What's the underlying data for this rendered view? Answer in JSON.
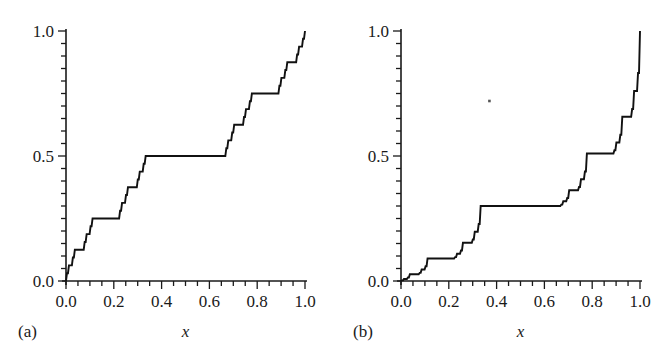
{
  "figure": {
    "background": "#ffffff",
    "ink": "#1a1a1a",
    "curve_color": "#111111",
    "width": 670,
    "height": 362
  },
  "chart_data": [
    {
      "type": "line",
      "panel": "a",
      "panel_label": "(a)",
      "title": "",
      "subtitle": "",
      "xlabel": "x",
      "ylabel": "",
      "xlim": [
        0.0,
        1.0
      ],
      "ylim": [
        0.0,
        1.0
      ],
      "grid": false,
      "legend": null,
      "xticks": [
        0.0,
        0.1,
        0.2,
        0.3,
        0.4,
        0.5,
        0.6,
        0.7,
        0.8,
        0.9,
        1.0
      ],
      "xticklabels": [
        "0.0",
        "",
        "0.2",
        "",
        "0.4",
        "",
        "0.6",
        "",
        "0.8",
        "",
        "1.0"
      ],
      "xminorticks": [
        0.05,
        0.15,
        0.25,
        0.35,
        0.45,
        0.55,
        0.65,
        0.75,
        0.85,
        0.95
      ],
      "yticks": [
        0.0,
        0.1,
        0.2,
        0.3,
        0.4,
        0.5,
        0.6,
        0.7,
        0.8,
        0.9,
        1.0
      ],
      "yticklabels": [
        "0.0",
        "",
        "",
        "",
        "",
        "0.5",
        "",
        "",
        "",
        "",
        "1.0"
      ],
      "yminorticks": [
        0.05,
        0.15,
        0.25,
        0.35,
        0.45,
        0.55,
        0.65,
        0.75,
        0.85,
        0.95
      ],
      "description": "Cantor function (devil's staircase), symmetric measure",
      "curve": {
        "kind": "cantor-staircase",
        "left_weight": 0.5,
        "depth": 5,
        "middle_third_cut": [
          0.3333333333,
          0.6666666667
        ],
        "plateaus": [
          {
            "x_start": 0.3333333333,
            "x_end": 0.6666666667,
            "y": 0.5
          },
          {
            "x_start": 0.1111111111,
            "x_end": 0.2222222222,
            "y": 0.25
          },
          {
            "x_start": 0.7777777778,
            "x_end": 0.8888888889,
            "y": 0.75
          }
        ],
        "anchor_points": [
          {
            "x": 0.0,
            "y": 0.0
          },
          {
            "x": 0.3333333333,
            "y": 0.5
          },
          {
            "x": 0.6666666667,
            "y": 0.5
          },
          {
            "x": 1.0,
            "y": 1.0
          }
        ]
      }
    },
    {
      "type": "line",
      "panel": "b",
      "panel_label": "(b)",
      "title": "",
      "subtitle": "",
      "xlabel": "x",
      "ylabel": "",
      "xlim": [
        0.0,
        1.0
      ],
      "ylim": [
        0.0,
        1.0
      ],
      "grid": false,
      "legend": null,
      "xticks": [
        0.0,
        0.1,
        0.2,
        0.3,
        0.4,
        0.5,
        0.6,
        0.7,
        0.8,
        0.9,
        1.0
      ],
      "xticklabels": [
        "0.0",
        "",
        "0.2",
        "",
        "0.4",
        "",
        "0.6",
        "",
        "0.8",
        "",
        "1.0"
      ],
      "xminorticks": [
        0.05,
        0.15,
        0.25,
        0.35,
        0.45,
        0.55,
        0.65,
        0.75,
        0.85,
        0.95
      ],
      "yticks": [
        0.0,
        0.1,
        0.2,
        0.3,
        0.4,
        0.5,
        0.6,
        0.7,
        0.8,
        0.9,
        1.0
      ],
      "yticklabels": [
        "0.0",
        "",
        "",
        "",
        "",
        "0.5",
        "",
        "",
        "",
        "",
        "1.0"
      ],
      "yminorticks": [
        0.05,
        0.15,
        0.25,
        0.35,
        0.45,
        0.55,
        0.65,
        0.75,
        0.85,
        0.95
      ],
      "description": "Asymmetric (multifractal) Cantor function, devil's staircase",
      "curve": {
        "kind": "cantor-staircase",
        "left_weight": 0.3,
        "depth": 5,
        "middle_third_cut": [
          0.3333333333,
          0.6666666667
        ],
        "plateaus": [
          {
            "x_start": 0.3333333333,
            "x_end": 0.6666666667,
            "y": 0.3
          },
          {
            "x_start": 0.1111111111,
            "x_end": 0.2222222222,
            "y": 0.09
          },
          {
            "x_start": 0.7777777778,
            "x_end": 0.8888888889,
            "y": 0.51
          }
        ],
        "anchor_points": [
          {
            "x": 0.0,
            "y": 0.0
          },
          {
            "x": 0.3333333333,
            "y": 0.3
          },
          {
            "x": 0.6666666667,
            "y": 0.3
          },
          {
            "x": 1.0,
            "y": 1.0
          }
        ]
      },
      "artifact_speck": {
        "x": 0.37,
        "y": 0.72
      }
    }
  ]
}
